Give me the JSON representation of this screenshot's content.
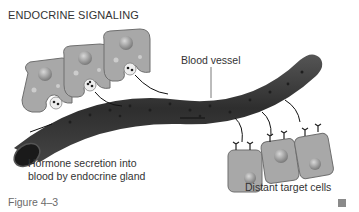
{
  "figure": {
    "title": "ENDOCRINE SIGNALING",
    "caption": "Figure 4–3",
    "labels": {
      "blood_vessel": "Blood vessel",
      "secretion_line1": "Hormone secretion into",
      "secretion_line2": "blood by endocrine gland",
      "target_cells": "Distant target cells"
    },
    "elements": {
      "secreting_cells": 3,
      "target_cells": 3
    },
    "colors": {
      "cell_fill": "#a8a8a8",
      "cell_stroke": "#6e6e6e",
      "vessel_fill": "#3a3a3a",
      "hormone_dot": "#1e1e1e",
      "text": "#333333"
    }
  }
}
